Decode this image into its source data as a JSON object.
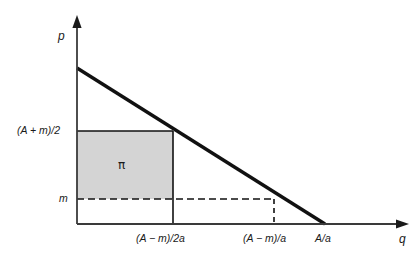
{
  "figure": {
    "type": "economics-diagram",
    "background_color": "#ffffff",
    "line_color": "#111111",
    "shade_color": "#d4d4d4",
    "axes": {
      "x_axis_label": "q",
      "y_axis_label": "p",
      "origin_px": [
        77,
        224
      ]
    },
    "y_ticks": [
      {
        "label": "(A + m)/2",
        "y_px": 131
      },
      {
        "label": "m",
        "y_px": 199
      }
    ],
    "x_ticks": [
      {
        "label": "(A − m)/2a",
        "x_px": 173,
        "style": "solid"
      },
      {
        "label": "(A − m)/a",
        "x_px": 274,
        "style": "dashed"
      },
      {
        "label": "A/a",
        "x_px": 325,
        "style": "none"
      }
    ],
    "demand_line": {
      "from_px": [
        77,
        68
      ],
      "to_px": [
        325,
        224
      ],
      "style": "solid-thick"
    },
    "shaded_region": {
      "label": "π",
      "x_px": 77,
      "y_px": 131,
      "width_px": 96,
      "height_px": 68
    },
    "dashed_guides": [
      {
        "name": "m-horizontal",
        "from_px": [
          77,
          199
        ],
        "to_px": [
          274,
          199
        ]
      },
      {
        "name": "q-vertical",
        "from_px": [
          274,
          199
        ],
        "to_px": [
          274,
          224
        ]
      }
    ]
  }
}
